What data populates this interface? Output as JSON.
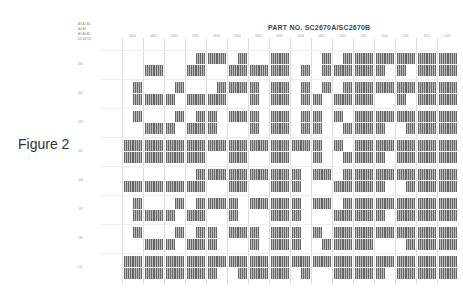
{
  "figure": {
    "label": "Figure 2"
  },
  "title": "PART NO. SC2670A/SC2670B",
  "header_key": [
    "A3 A2 A1",
    "A0 A4",
    "A7 A6 A5",
    "D0 D4 D8"
  ],
  "columns": [
    "0000",
    "0001",
    "0010",
    "0011",
    "0100",
    "0101",
    "0110",
    "0111",
    "1000",
    "1001",
    "1010",
    "1011",
    "1100",
    "1101",
    "1110",
    "1111"
  ],
  "rows": [
    "000",
    "001",
    "010",
    "011",
    "100",
    "101",
    "110",
    "111"
  ],
  "patterns": [
    [
      0,
      3,
      0,
      7,
      12,
      7,
      3,
      15,
      1,
      5,
      7,
      15,
      14,
      14,
      15,
      15
    ],
    [
      5,
      3,
      6,
      3,
      7,
      12,
      10,
      15,
      5,
      6,
      7,
      15,
      12,
      14,
      15,
      15
    ],
    [
      4,
      3,
      6,
      7,
      10,
      12,
      10,
      15,
      5,
      10,
      9,
      15,
      14,
      13,
      15,
      15
    ],
    [
      15,
      15,
      15,
      15,
      12,
      15,
      12,
      15,
      12,
      10,
      9,
      15,
      14,
      15,
      15,
      15
    ],
    [
      3,
      3,
      3,
      7,
      12,
      15,
      12,
      15,
      10,
      12,
      7,
      15,
      14,
      13,
      15,
      15
    ],
    [
      5,
      3,
      6,
      7,
      12,
      10,
      12,
      15,
      10,
      12,
      7,
      15,
      14,
      15,
      15,
      15
    ],
    [
      4,
      3,
      6,
      7,
      10,
      12,
      10,
      15,
      10,
      9,
      15,
      15,
      12,
      13,
      15,
      15
    ],
    [
      15,
      15,
      15,
      15,
      14,
      13,
      15,
      15,
      13,
      12,
      15,
      15,
      14,
      15,
      15,
      15
    ]
  ]
}
